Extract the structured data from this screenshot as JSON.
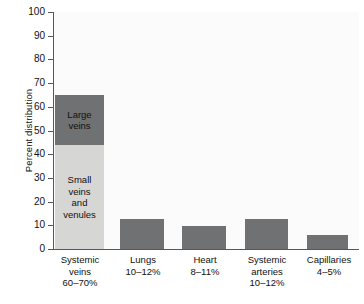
{
  "chart_data": {
    "type": "bar",
    "title": "",
    "subtitle": "",
    "xlabel": "",
    "ylabel": "Percent distribution",
    "ylim": [
      0,
      100
    ],
    "ytick_values": [
      0,
      10,
      20,
      30,
      40,
      50,
      60,
      70,
      80,
      90,
      100
    ],
    "ytick_labels": [
      "0",
      "10",
      "20",
      "30",
      "40",
      "50",
      "60",
      "70",
      "80",
      "90",
      "100"
    ],
    "grid": false,
    "legend_position": "none",
    "stacked_first_bar": true,
    "categories": [
      "Systemic veins",
      "Lungs",
      "Heart",
      "Systemic arteries",
      "Capillaries"
    ],
    "category_ranges": [
      "60–70%",
      "10–12%",
      "8–11%",
      "10–12%",
      "4–5%"
    ],
    "values": [
      65,
      13,
      10,
      13,
      6
    ],
    "bars": [
      {
        "category": "Systemic veins",
        "range_label": "60–70%",
        "total": 65,
        "segments": [
          {
            "name": "Large veins",
            "label": "Large\nveins",
            "value": 21,
            "from": 44,
            "to": 65,
            "color": "#6f7173"
          },
          {
            "name": "Small veins and venules",
            "label": "Small\nveins\nand\nvenules",
            "value": 44,
            "from": 0,
            "to": 44,
            "color": "#d6d6d4"
          }
        ]
      },
      {
        "category": "Lungs",
        "range_label": "10–12%",
        "total": 13,
        "segments": [
          {
            "name": "Lungs",
            "label": "",
            "value": 13,
            "from": 0,
            "to": 13,
            "color": "#6f7173"
          }
        ]
      },
      {
        "category": "Heart",
        "range_label": "8–11%",
        "total": 10,
        "segments": [
          {
            "name": "Heart",
            "label": "",
            "value": 10,
            "from": 0,
            "to": 10,
            "color": "#6f7173"
          }
        ]
      },
      {
        "category": "Systemic arteries",
        "range_label": "10–12%",
        "total": 13,
        "segments": [
          {
            "name": "Systemic arteries",
            "label": "",
            "value": 13,
            "from": 0,
            "to": 13,
            "color": "#6f7173"
          }
        ]
      },
      {
        "category": "Capillaries",
        "range_label": "4–5%",
        "total": 6,
        "segments": [
          {
            "name": "Capillaries",
            "label": "",
            "value": 6,
            "from": 0,
            "to": 6,
            "color": "#6f7173"
          }
        ]
      }
    ],
    "colors": {
      "dark_segment": "#6f7173",
      "light_segment": "#d6d6d4",
      "plot_background": "#fbfbfb",
      "axis": "#55585a",
      "text": "#111111",
      "page_background": "#ffffff"
    }
  },
  "axis": {
    "y_title": "Percent distribution"
  }
}
